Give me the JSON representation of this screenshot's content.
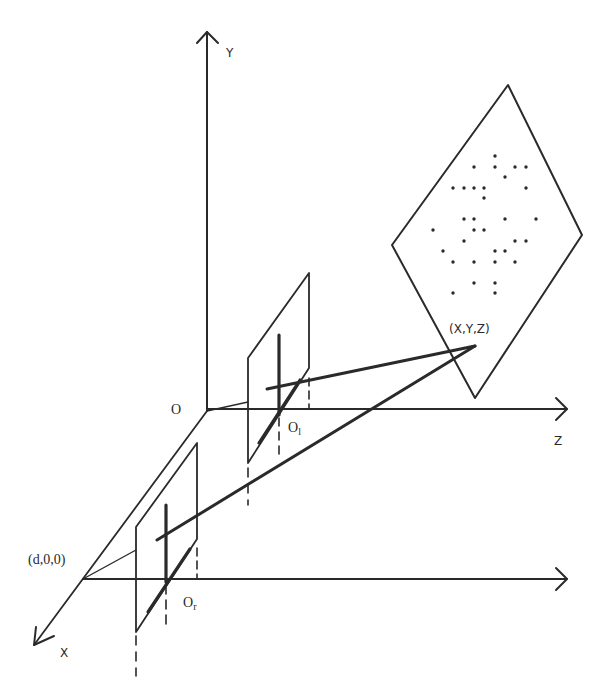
{
  "diagram": {
    "labels": {
      "y_axis": "Y",
      "z_axis": "Z",
      "x_axis": "X",
      "origin": "O",
      "left_center": "O",
      "left_center_sub": "l",
      "right_center": "O",
      "right_center_sub": "r",
      "baseline_point": "(d,0,0)",
      "world_point": "(X,Y,Z)"
    },
    "colors": {
      "stroke": "#2a2a2a",
      "background": "#ffffff"
    },
    "dots": [
      [
        495,
        156
      ],
      [
        474,
        167
      ],
      [
        495,
        167
      ],
      [
        515,
        167
      ],
      [
        526,
        167
      ],
      [
        505,
        177
      ],
      [
        453,
        188
      ],
      [
        464,
        188
      ],
      [
        474,
        188
      ],
      [
        484,
        188
      ],
      [
        526,
        188
      ],
      [
        484,
        198
      ],
      [
        464,
        219
      ],
      [
        474,
        219
      ],
      [
        505,
        219
      ],
      [
        536,
        219
      ],
      [
        433,
        230
      ],
      [
        474,
        230
      ],
      [
        484,
        230
      ],
      [
        464,
        241
      ],
      [
        515,
        241
      ],
      [
        526,
        241
      ],
      [
        443,
        251
      ],
      [
        495,
        251
      ],
      [
        505,
        251
      ],
      [
        453,
        262
      ],
      [
        474,
        262
      ],
      [
        495,
        262
      ],
      [
        515,
        262
      ],
      [
        474,
        283
      ],
      [
        495,
        283
      ],
      [
        453,
        293
      ],
      [
        495,
        293
      ]
    ]
  }
}
